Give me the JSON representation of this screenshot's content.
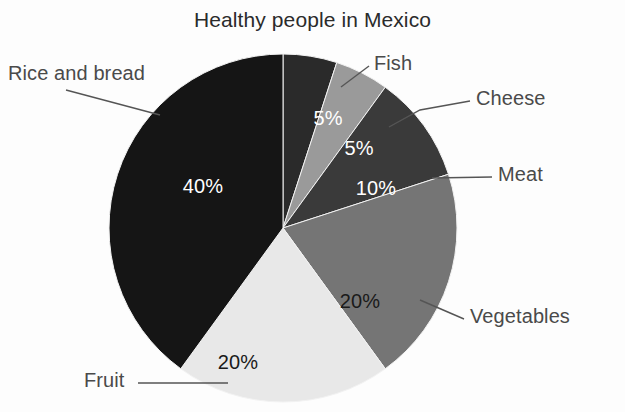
{
  "chart_data": {
    "type": "pie",
    "title": "Healthy people in Mexico",
    "xlabel": "",
    "ylabel": "",
    "legend_position": "none",
    "grid": false,
    "labels_outside": true,
    "units": "%",
    "categories": [
      "Fish",
      "Cheese",
      "Meat",
      "Vegetables",
      "Fruit",
      "Rice and bread"
    ],
    "values": [
      5,
      5,
      10,
      20,
      20,
      40
    ],
    "value_labels": [
      "5%",
      "5%",
      "10%",
      "20%",
      "20%",
      "40%"
    ],
    "colors": [
      "#2a2a2a",
      "#9a9a9a",
      "#3a3a3a",
      "#757575",
      "#e8e8e8",
      "#151515"
    ],
    "slices": [
      {
        "label": "Fish",
        "value": 5,
        "value_label": "5%",
        "color": "#2a2a2a",
        "label_color": "#4a4a4a",
        "value_text_color": "#ffffff",
        "start_angle": 0,
        "end_angle": 18,
        "value_pos": {
          "x": 328,
          "y": 118
        },
        "label_pos": {
          "x": 374,
          "y": 52
        },
        "leader": [
          {
            "x": 341,
            "y": 87
          },
          {
            "x": 369,
            "y": 66
          }
        ]
      },
      {
        "label": "Cheese",
        "value": 5,
        "value_label": "5%",
        "color": "#9a9a9a",
        "label_color": "#4a4a4a",
        "value_text_color": "#ffffff",
        "start_angle": 18,
        "end_angle": 36,
        "value_pos": {
          "x": 359,
          "y": 148
        },
        "label_pos": {
          "x": 476,
          "y": 87
        },
        "leader": [
          {
            "x": 389,
            "y": 127
          },
          {
            "x": 420,
            "y": 110
          },
          {
            "x": 470,
            "y": 101
          }
        ]
      },
      {
        "label": "Meat",
        "value": 10,
        "value_label": "10%",
        "color": "#3a3a3a",
        "label_color": "#4a4a4a",
        "value_text_color": "#ffffff",
        "start_angle": 36,
        "end_angle": 72,
        "value_pos": {
          "x": 376,
          "y": 188
        },
        "label_pos": {
          "x": 498,
          "y": 163
        },
        "leader": [
          {
            "x": 432,
            "y": 178
          },
          {
            "x": 492,
            "y": 177
          }
        ]
      },
      {
        "label": "Vegetables",
        "value": 20,
        "value_label": "20%",
        "color": "#757575",
        "label_color": "#4a4a4a",
        "value_text_color": "#1a1a1a",
        "start_angle": 72,
        "end_angle": 144,
        "value_pos": {
          "x": 360,
          "y": 301
        },
        "label_pos": {
          "x": 470,
          "y": 305
        },
        "leader": [
          {
            "x": 420,
            "y": 300
          },
          {
            "x": 464,
            "y": 319
          }
        ]
      },
      {
        "label": "Fruit",
        "value": 20,
        "value_label": "20%",
        "color": "#e8e8e8",
        "label_color": "#4a4a4a",
        "value_text_color": "#1a1a1a",
        "start_angle": 144,
        "end_angle": 216,
        "value_pos": {
          "x": 238,
          "y": 362
        },
        "label_pos": {
          "x": 84,
          "y": 369
        },
        "leader": [
          {
            "x": 138,
            "y": 383
          },
          {
            "x": 228,
            "y": 383
          }
        ]
      },
      {
        "label": "Rice and bread",
        "value": 40,
        "value_label": "40%",
        "color": "#151515",
        "label_color": "#4a4a4a",
        "value_text_color": "#ffffff",
        "start_angle": 216,
        "end_angle": 360,
        "value_pos": {
          "x": 203,
          "y": 186
        },
        "label_pos": {
          "x": 8,
          "y": 62
        },
        "leader": [
          {
            "x": 66,
            "y": 90
          },
          {
            "x": 160,
            "y": 115
          }
        ]
      }
    ],
    "geometry": {
      "center_x": 283,
      "center_y": 228,
      "radius": 174
    }
  }
}
